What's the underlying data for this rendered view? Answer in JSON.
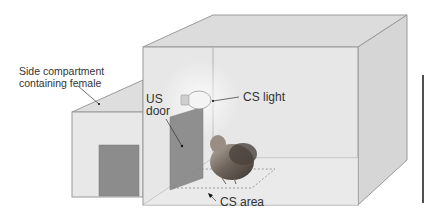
{
  "figure": {
    "labels": {
      "side_compartment_line1": "Side compartment",
      "side_compartment_line2": "containing female",
      "us_door_line1": "US",
      "us_door_line2": "door",
      "cs_light": "CS light",
      "cs_area": "CS area"
    },
    "colors": {
      "box_face": "#e6e6e6",
      "box_top": "#dcdcdc",
      "box_side": "#d8d8d8",
      "edge": "#9a9a9a",
      "door": "#8a8a8a",
      "scale_bar": "#222222",
      "text": "#333333"
    },
    "scale_bar": {
      "visible": true
    }
  }
}
